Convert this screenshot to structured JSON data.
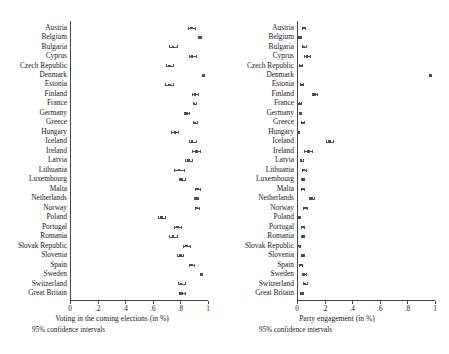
{
  "figure": {
    "type": "dot-and-whisker-pair",
    "background": "#ffffff",
    "marker_color": "#4d4d4d",
    "line_color": "#555555",
    "axis_color": "#444444"
  },
  "chart_data": [
    {
      "type": "scatter",
      "panel": "left",
      "title": "",
      "xlabel": "Voting in the coming elections (in %)",
      "ylabel": "",
      "note": "95% confidence intervals",
      "xlim": [
        0,
        1
      ],
      "xticks": [
        0,
        0.2,
        0.4,
        0.6,
        0.8,
        1
      ],
      "xticklabels": [
        "0",
        ".2",
        ".4",
        ".6",
        ".8",
        "1"
      ],
      "grid": false,
      "orientation": "horizontal",
      "categories": [
        "Austria",
        "Belgium",
        "Bulgaria",
        "Cyprus",
        "Czech Republic",
        "Denmark",
        "Estonia",
        "Finland",
        "France",
        "Germany",
        "Greece",
        "Hungary",
        "Iceland",
        "Ireland",
        "Latvia",
        "Lithuania",
        "Luxembourg",
        "Malta",
        "Netherlands",
        "Norway",
        "Poland",
        "Portugal",
        "Romania",
        "Slovak Republic",
        "Slovenia",
        "Spain",
        "Sweden",
        "Switzerland",
        "Great Britain"
      ],
      "points": [
        {
          "category": "Austria",
          "value": 0.88,
          "low": 0.855,
          "high": 0.905
        },
        {
          "category": "Belgium",
          "value": 0.94,
          "low": 0.93,
          "high": 0.95
        },
        {
          "category": "Bulgaria",
          "value": 0.745,
          "low": 0.715,
          "high": 0.775
        },
        {
          "category": "Cyprus",
          "value": 0.885,
          "low": 0.86,
          "high": 0.91
        },
        {
          "category": "Czech Republic",
          "value": 0.72,
          "low": 0.695,
          "high": 0.745
        },
        {
          "category": "Denmark",
          "value": 0.965,
          "low": 0.958,
          "high": 0.972
        },
        {
          "category": "Estonia",
          "value": 0.72,
          "low": 0.692,
          "high": 0.748
        },
        {
          "category": "Finland",
          "value": 0.905,
          "low": 0.885,
          "high": 0.925
        },
        {
          "category": "France",
          "value": 0.9,
          "low": 0.888,
          "high": 0.912
        },
        {
          "category": "Germany",
          "value": 0.845,
          "low": 0.825,
          "high": 0.865
        },
        {
          "category": "Greece",
          "value": 0.905,
          "low": 0.888,
          "high": 0.922
        },
        {
          "category": "Hungary",
          "value": 0.76,
          "low": 0.735,
          "high": 0.785
        },
        {
          "category": "Iceland",
          "value": 0.885,
          "low": 0.86,
          "high": 0.91
        },
        {
          "category": "Ireland",
          "value": 0.915,
          "low": 0.885,
          "high": 0.945
        },
        {
          "category": "Latvia",
          "value": 0.86,
          "low": 0.835,
          "high": 0.885
        },
        {
          "category": "Lithuania",
          "value": 0.79,
          "low": 0.755,
          "high": 0.825
        },
        {
          "category": "Luxembourg",
          "value": 0.81,
          "low": 0.788,
          "high": 0.832
        },
        {
          "category": "Malta",
          "value": 0.925,
          "low": 0.905,
          "high": 0.945
        },
        {
          "category": "Netherlands",
          "value": 0.915,
          "low": 0.902,
          "high": 0.928
        },
        {
          "category": "Norway",
          "value": 0.918,
          "low": 0.903,
          "high": 0.933
        },
        {
          "category": "Poland",
          "value": 0.665,
          "low": 0.638,
          "high": 0.692
        },
        {
          "category": "Portugal",
          "value": 0.78,
          "low": 0.757,
          "high": 0.803
        },
        {
          "category": "Romania",
          "value": 0.745,
          "low": 0.715,
          "high": 0.775
        },
        {
          "category": "Slovak Republic",
          "value": 0.845,
          "low": 0.822,
          "high": 0.868
        },
        {
          "category": "Slovenia",
          "value": 0.8,
          "low": 0.778,
          "high": 0.822
        },
        {
          "category": "Spain",
          "value": 0.88,
          "low": 0.862,
          "high": 0.898
        },
        {
          "category": "Sweden",
          "value": 0.95,
          "low": 0.942,
          "high": 0.958
        },
        {
          "category": "Switzerland",
          "value": 0.805,
          "low": 0.78,
          "high": 0.83
        },
        {
          "category": "Great Britain",
          "value": 0.81,
          "low": 0.788,
          "high": 0.832
        }
      ]
    },
    {
      "type": "scatter",
      "panel": "right",
      "title": "",
      "xlabel": "Party engagement (in %)",
      "ylabel": "",
      "note": "95% confidence intervals",
      "xlim": [
        0,
        1
      ],
      "xticks": [
        0,
        0.2,
        0.4,
        0.6,
        0.8,
        1
      ],
      "xticklabels": [
        "0",
        ".2",
        ".4",
        ".6",
        ".8",
        "1"
      ],
      "grid": false,
      "orientation": "horizontal",
      "categories": [
        "Austria",
        "Belgium",
        "Bulgaria",
        "Cyprus",
        "Czech Republic",
        "Denmark",
        "Estonia",
        "Finland",
        "France",
        "Germany",
        "Greece",
        "Hungary",
        "Iceland",
        "Ireland",
        "Latvia",
        "Lithuania",
        "Luxembourg",
        "Malta",
        "Netherlands",
        "Norway",
        "Poland",
        "Portugal",
        "Romania",
        "Slovak Republic",
        "Slovenia",
        "Spain",
        "Sweden",
        "Switzerland",
        "Great Britain"
      ],
      "points": [
        {
          "category": "Austria",
          "value": 0.045,
          "low": 0.033,
          "high": 0.057
        },
        {
          "category": "Belgium",
          "value": 0.02,
          "low": 0.013,
          "high": 0.027
        },
        {
          "category": "Bulgaria",
          "value": 0.048,
          "low": 0.033,
          "high": 0.063
        },
        {
          "category": "Cyprus",
          "value": 0.072,
          "low": 0.052,
          "high": 0.092
        },
        {
          "category": "Czech Republic",
          "value": 0.025,
          "low": 0.016,
          "high": 0.034
        },
        {
          "category": "Denmark",
          "value": 0.968,
          "low": 0.962,
          "high": 0.974
        },
        {
          "category": "Estonia",
          "value": 0.033,
          "low": 0.023,
          "high": 0.043
        },
        {
          "category": "Finland",
          "value": 0.128,
          "low": 0.108,
          "high": 0.148
        },
        {
          "category": "France",
          "value": 0.02,
          "low": 0.013,
          "high": 0.027
        },
        {
          "category": "Germany",
          "value": 0.022,
          "low": 0.014,
          "high": 0.03
        },
        {
          "category": "Greece",
          "value": 0.038,
          "low": 0.028,
          "high": 0.048
        },
        {
          "category": "Hungary",
          "value": 0.008,
          "low": 0.003,
          "high": 0.013
        },
        {
          "category": "Iceland",
          "value": 0.235,
          "low": 0.208,
          "high": 0.262
        },
        {
          "category": "Ireland",
          "value": 0.082,
          "low": 0.052,
          "high": 0.112
        },
        {
          "category": "Latvia",
          "value": 0.03,
          "low": 0.02,
          "high": 0.04
        },
        {
          "category": "Lithuania",
          "value": 0.048,
          "low": 0.033,
          "high": 0.063
        },
        {
          "category": "Luxembourg",
          "value": 0.042,
          "low": 0.03,
          "high": 0.054
        },
        {
          "category": "Malta",
          "value": 0.038,
          "low": 0.026,
          "high": 0.05
        },
        {
          "category": "Netherlands",
          "value": 0.105,
          "low": 0.09,
          "high": 0.12
        },
        {
          "category": "Norway",
          "value": 0.06,
          "low": 0.046,
          "high": 0.074
        },
        {
          "category": "Poland",
          "value": 0.015,
          "low": 0.008,
          "high": 0.022
        },
        {
          "category": "Portugal",
          "value": 0.04,
          "low": 0.028,
          "high": 0.052
        },
        {
          "category": "Romania",
          "value": 0.042,
          "low": 0.03,
          "high": 0.054
        },
        {
          "category": "Slovak Republic",
          "value": 0.018,
          "low": 0.011,
          "high": 0.025
        },
        {
          "category": "Slovenia",
          "value": 0.04,
          "low": 0.028,
          "high": 0.052
        },
        {
          "category": "Spain",
          "value": 0.025,
          "low": 0.016,
          "high": 0.034
        },
        {
          "category": "Sweden",
          "value": 0.052,
          "low": 0.038,
          "high": 0.066
        },
        {
          "category": "Switzerland",
          "value": 0.055,
          "low": 0.04,
          "high": 0.07
        },
        {
          "category": "Great Britain",
          "value": 0.032,
          "low": 0.022,
          "high": 0.042
        }
      ]
    }
  ]
}
